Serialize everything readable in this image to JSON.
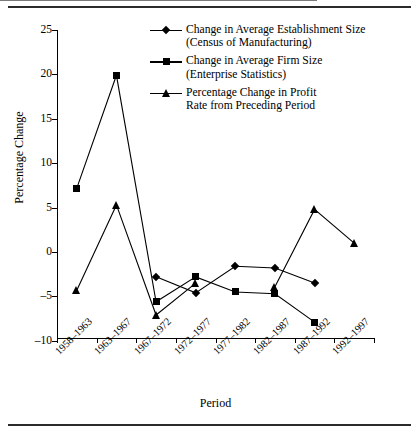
{
  "chart_data": {
    "type": "line",
    "title": "",
    "xlabel": "Period",
    "ylabel": "Percentage Change",
    "categories": [
      "1958–1963",
      "1963–1967",
      "1967–1972",
      "1972–1977",
      "1977–1982",
      "1982–1987",
      "1987–1992",
      "1992–1997"
    ],
    "yticks": [
      25,
      20,
      15,
      10,
      5,
      0,
      -5,
      -10
    ],
    "ytick_labels": [
      "25",
      "20",
      "15",
      "10",
      "5",
      "0",
      "–5",
      "–10"
    ],
    "ylim": [
      -10,
      25
    ],
    "grid": false,
    "zero_line": true,
    "legend_position": "top-right-inside",
    "series": [
      {
        "name": "Change in Average Establishment Size (Census of Manufacturing)",
        "marker": "diamond",
        "values": [
          null,
          null,
          -2.8,
          -4.6,
          -1.6,
          -1.8,
          -3.5,
          null
        ]
      },
      {
        "name": "Change in  Average Firm  Size (Enterprise Statistics)",
        "marker": "square",
        "values": [
          7.2,
          19.9,
          -5.6,
          -2.8,
          -4.5,
          -4.7,
          -7.9,
          null
        ]
      },
      {
        "name": "Percentage Change in Profit Rate from Preceding Period",
        "marker": "triangle",
        "values": [
          -4.3,
          5.3,
          -7.1,
          -3.5,
          null,
          -3.9,
          4.8,
          1.0
        ]
      }
    ]
  },
  "legend": [
    {
      "marker": "diamond",
      "line1": "Change in Average Establishment Size",
      "line2": "(Census of Manufacturing)"
    },
    {
      "marker": "square",
      "line1": "Change in  Average Firm  Size",
      "line2": "(Enterprise Statistics)"
    },
    {
      "marker": "triangle",
      "line1": "Percentage Change in Profit",
      "line2": "Rate from Preceding Period"
    }
  ],
  "axes": {
    "ylabel": "Percentage Change",
    "xlabel": "Period"
  }
}
